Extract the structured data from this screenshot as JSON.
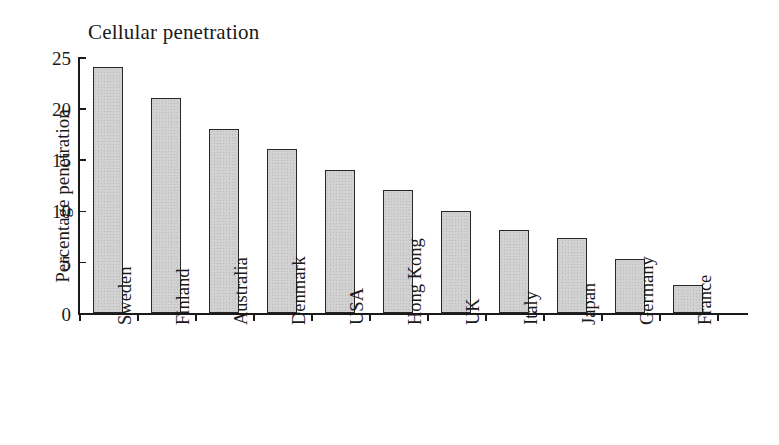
{
  "figure": {
    "width": 779,
    "height": 445,
    "background": "#ffffff",
    "ink_color": "#1a1a1a",
    "bar_fill": "#d2d2d2",
    "bar_outline": "#262626"
  },
  "chart_data": {
    "type": "bar",
    "title": "Cellular penetration",
    "xlabel": "",
    "ylabel": "Percentage penetration",
    "categories": [
      "Sweden",
      "Finland",
      "Australia",
      "Denmark",
      "USA",
      "Hong Kong",
      "UK",
      "Italy",
      "Japan",
      "Germany",
      "France"
    ],
    "values": [
      24.0,
      21.0,
      18.0,
      16.0,
      14.0,
      12.0,
      10.0,
      8.1,
      7.3,
      5.3,
      2.7
    ],
    "ylim": [
      0,
      25
    ],
    "yticks": [
      0,
      5,
      10,
      15,
      20,
      25
    ],
    "ytick_labels": [
      "0",
      "5",
      "10",
      "15",
      "20",
      "25"
    ],
    "grid": false,
    "legend": false,
    "legend_position": "none",
    "tick_direction": {
      "y": "in",
      "x": "out"
    },
    "xtick_label_rotation": 90,
    "bar_count": 11
  }
}
